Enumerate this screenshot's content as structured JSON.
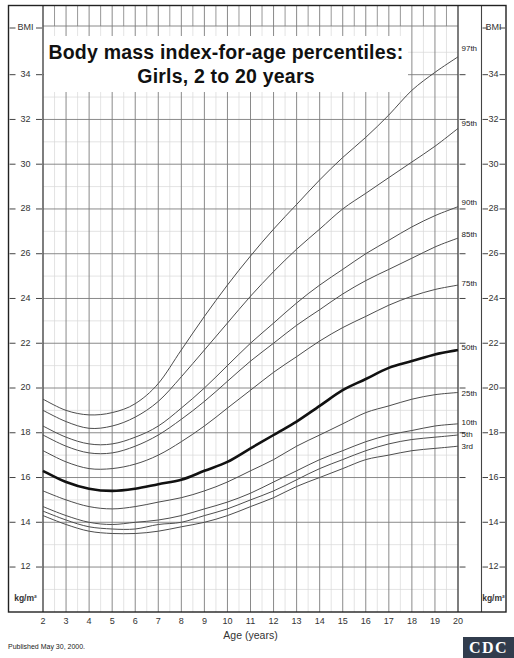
{
  "title": {
    "line1": "Body mass index-for-age percentiles:",
    "line2": "Girls, 2 to 20 years"
  },
  "footer": {
    "published": "Published May 30, 2000.",
    "logo_text": "CDC"
  },
  "axis": {
    "bmi_label": "BMI",
    "unit_label": "kg/m²",
    "x_label": "Age (years)",
    "y_tick_labels": [
      34,
      32,
      30,
      28,
      26,
      24,
      22,
      20,
      18,
      16,
      14,
      12
    ],
    "x_tick_labels": [
      2,
      3,
      4,
      5,
      6,
      7,
      8,
      9,
      10,
      11,
      12,
      13,
      14,
      15,
      16,
      17,
      18,
      19,
      20
    ]
  },
  "chart_data": {
    "type": "line",
    "title": "Body mass index-for-age percentiles: Girls, 2 to 20 years",
    "xlabel": "Age (years)",
    "ylabel": "BMI (kg/m²)",
    "xlim": [
      2,
      20
    ],
    "ylim": [
      10,
      36
    ],
    "y_major_step": 2,
    "y_minor_step": 1,
    "x_major_step": 1,
    "x_minor_step": 0.5,
    "grid": true,
    "legend_position": "right-of-curve-ends",
    "x": [
      2,
      3,
      4,
      5,
      6,
      7,
      8,
      9,
      10,
      11,
      12,
      13,
      14,
      15,
      16,
      17,
      18,
      19,
      20
    ],
    "series": [
      {
        "name": "97th",
        "emphasis": false,
        "values": [
          19.5,
          19.0,
          18.8,
          18.9,
          19.3,
          20.2,
          21.7,
          23.2,
          24.6,
          25.9,
          27.1,
          28.2,
          29.3,
          30.3,
          31.2,
          32.2,
          33.3,
          34.1,
          34.8
        ]
      },
      {
        "name": "95th",
        "emphasis": false,
        "values": [
          19.0,
          18.5,
          18.2,
          18.3,
          18.7,
          19.4,
          20.5,
          21.7,
          22.9,
          24.1,
          25.2,
          26.2,
          27.1,
          28.0,
          28.7,
          29.4,
          30.1,
          30.8,
          31.6
        ]
      },
      {
        "name": "90th",
        "emphasis": false,
        "values": [
          18.3,
          17.8,
          17.5,
          17.5,
          17.8,
          18.3,
          19.1,
          20.0,
          21.0,
          22.0,
          22.9,
          23.8,
          24.6,
          25.3,
          26.0,
          26.6,
          27.2,
          27.7,
          28.1
        ]
      },
      {
        "name": "85th",
        "emphasis": false,
        "values": [
          17.9,
          17.4,
          17.1,
          17.1,
          17.4,
          17.9,
          18.6,
          19.4,
          20.3,
          21.2,
          22.0,
          22.8,
          23.5,
          24.2,
          24.8,
          25.3,
          25.8,
          26.3,
          26.7
        ]
      },
      {
        "name": "75th",
        "emphasis": false,
        "values": [
          17.2,
          16.7,
          16.4,
          16.4,
          16.6,
          17.0,
          17.6,
          18.3,
          19.1,
          19.9,
          20.7,
          21.4,
          22.1,
          22.7,
          23.2,
          23.7,
          24.1,
          24.4,
          24.6
        ]
      },
      {
        "name": "50th",
        "emphasis": true,
        "values": [
          16.3,
          15.8,
          15.5,
          15.4,
          15.5,
          15.7,
          15.9,
          16.3,
          16.7,
          17.3,
          17.9,
          18.5,
          19.2,
          19.9,
          20.4,
          20.9,
          21.2,
          21.5,
          21.7
        ]
      },
      {
        "name": "25th",
        "emphasis": false,
        "values": [
          15.4,
          15.0,
          14.7,
          14.6,
          14.7,
          14.9,
          15.1,
          15.4,
          15.8,
          16.3,
          16.8,
          17.4,
          17.9,
          18.4,
          18.9,
          19.2,
          19.5,
          19.7,
          19.8
        ]
      },
      {
        "name": "10th",
        "emphasis": false,
        "values": [
          14.7,
          14.3,
          14.0,
          13.9,
          14.0,
          14.1,
          14.3,
          14.6,
          14.9,
          15.3,
          15.8,
          16.3,
          16.8,
          17.2,
          17.6,
          17.9,
          18.1,
          18.3,
          18.4
        ]
      },
      {
        "name": "5th",
        "emphasis": false,
        "values": [
          14.5,
          14.1,
          13.8,
          13.7,
          13.7,
          13.9,
          14.0,
          14.3,
          14.6,
          15.0,
          15.4,
          15.9,
          16.4,
          16.8,
          17.2,
          17.5,
          17.7,
          17.8,
          17.9
        ]
      },
      {
        "name": "3rd",
        "emphasis": false,
        "values": [
          14.3,
          13.9,
          13.6,
          13.5,
          13.5,
          13.6,
          13.8,
          14.0,
          14.3,
          14.7,
          15.1,
          15.6,
          16.0,
          16.4,
          16.8,
          17.0,
          17.2,
          17.3,
          17.4
        ]
      }
    ]
  },
  "style": {
    "frame_color": "#222222",
    "plot_edge_color": "#444444",
    "major_grid_color": "#7d7d7d",
    "minor_grid_color": "#d9d9d9",
    "curve_color": "#4d4d4d",
    "curve_emphasis_color": "#111111",
    "tick_label_color": "#333333",
    "percentile_label_color": "#222222",
    "logo_bg": "#313c4d",
    "logo_fg": "#ffffff"
  }
}
